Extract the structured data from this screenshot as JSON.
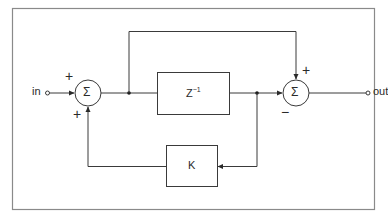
{
  "diagram": {
    "type": "block-diagram",
    "input": {
      "label": "in"
    },
    "output": {
      "label": "out"
    },
    "summers": [
      {
        "id": "sum1",
        "symbol": "Σ",
        "signs": {
          "left": "+",
          "bottom": "+"
        }
      },
      {
        "id": "sum2",
        "symbol": "Σ",
        "signs": {
          "top": "+",
          "left": "−"
        }
      }
    ],
    "blocks": [
      {
        "id": "delay",
        "label": "Z",
        "superscript": "−1"
      },
      {
        "id": "gain",
        "label": "K"
      }
    ],
    "colors": {
      "line": "#3a3a3a",
      "frame": "#8a8a8a",
      "background": "#ffffff"
    }
  }
}
